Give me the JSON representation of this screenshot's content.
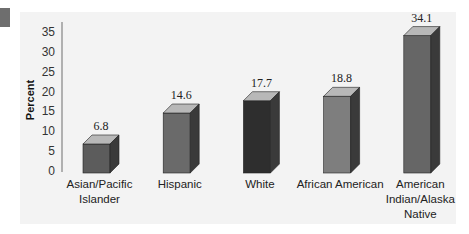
{
  "chart_data": {
    "type": "bar",
    "title": "",
    "xlabel": "",
    "ylabel": "Percent",
    "ylim": [
      0,
      35
    ],
    "yticks": [
      0,
      5,
      10,
      15,
      20,
      25,
      30,
      35
    ],
    "grid": false,
    "legend": "none",
    "style": "3d-bar",
    "categories": [
      [
        "Asian/Pacific",
        "Islander"
      ],
      [
        "Hispanic"
      ],
      [
        "White"
      ],
      [
        "African American"
      ],
      [
        "American",
        "Indian/Alaska",
        "Native"
      ]
    ],
    "category_names": [
      "Asian/Pacific Islander",
      "Hispanic",
      "White",
      "African American",
      "American Indian/Alaska Native"
    ],
    "values": [
      6.8,
      14.6,
      17.7,
      18.8,
      34.1
    ],
    "value_labels": [
      "6.8",
      "14.6",
      "17.7",
      "18.8",
      "34.1"
    ],
    "colors": {
      "front": [
        "#5c5c5c",
        "#6a6a6a",
        "#2e2e2e",
        "#7e7e7e",
        "#666666"
      ],
      "top": "#b8b8b8",
      "side": "#3a3a3a"
    }
  }
}
